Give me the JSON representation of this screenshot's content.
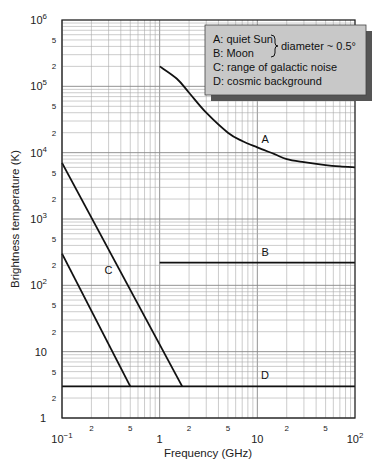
{
  "chart_data": {
    "type": "line",
    "title": "",
    "xlabel": "Frequency (GHz)",
    "ylabel": "Brightness temperature (K)",
    "xscale": "log",
    "yscale": "log",
    "xlim": [
      0.1,
      100
    ],
    "ylim": [
      1,
      1000000
    ],
    "grid": true,
    "x_major_ticks": [
      {
        "value": 0.1,
        "base": "10",
        "exp": "−1"
      },
      {
        "value": 1,
        "label": "1"
      },
      {
        "value": 10,
        "label": "10"
      },
      {
        "value": 100,
        "base": "10",
        "exp": "2"
      }
    ],
    "x_minor_labels": [
      {
        "value": 0.2,
        "label": "2"
      },
      {
        "value": 0.5,
        "label": "5"
      },
      {
        "value": 2,
        "label": "2"
      },
      {
        "value": 5,
        "label": "5"
      },
      {
        "value": 20,
        "label": "2"
      },
      {
        "value": 50,
        "label": "5"
      }
    ],
    "y_major_ticks": [
      {
        "value": 1,
        "label": "1"
      },
      {
        "value": 10,
        "label": "10"
      },
      {
        "value": 100,
        "base": "10",
        "exp": "2"
      },
      {
        "value": 1000,
        "base": "10",
        "exp": "3"
      },
      {
        "value": 10000,
        "base": "10",
        "exp": "4"
      },
      {
        "value": 100000,
        "base": "10",
        "exp": "5"
      },
      {
        "value": 1000000,
        "base": "10",
        "exp": "6"
      }
    ],
    "y_minor_labels": [
      {
        "value": 2,
        "label": "2"
      },
      {
        "value": 5,
        "label": "5"
      },
      {
        "value": 20,
        "label": "2"
      },
      {
        "value": 50,
        "label": "5"
      },
      {
        "value": 200,
        "label": "2"
      },
      {
        "value": 500,
        "label": "5"
      },
      {
        "value": 2000,
        "label": "2"
      },
      {
        "value": 5000,
        "label": "5"
      },
      {
        "value": 20000,
        "label": "2"
      },
      {
        "value": 50000,
        "label": "5"
      },
      {
        "value": 200000,
        "label": "2"
      },
      {
        "value": 500000,
        "label": "5"
      }
    ],
    "series": [
      {
        "name": "A: quiet Sun",
        "label": "A",
        "label_at": [
          12,
          14000
        ],
        "x": [
          1,
          1.5,
          2,
          3,
          5,
          7,
          10,
          15,
          20,
          30,
          50,
          70,
          100
        ],
        "y": [
          200000,
          130000,
          80000,
          40000,
          20000,
          15000,
          12000,
          9500,
          8000,
          7200,
          6500,
          6200,
          6000
        ]
      },
      {
        "name": "B: Moon",
        "label": "B",
        "label_at": [
          12,
          280
        ],
        "x": [
          1,
          100
        ],
        "y": [
          220,
          220
        ]
      },
      {
        "name": "C: range of galactic noise (upper bound)",
        "label": "C",
        "label_at": [
          0.3,
          150
        ],
        "x": [
          0.1,
          1.7
        ],
        "y": [
          7000,
          3
        ]
      },
      {
        "name": "C: range of galactic noise (lower bound)",
        "x": [
          0.1,
          0.5
        ],
        "y": [
          300,
          3
        ]
      },
      {
        "name": "D: cosmic background",
        "label": "D",
        "label_at": [
          12,
          3.9
        ],
        "x": [
          0.1,
          100
        ],
        "y": [
          3,
          3
        ]
      }
    ]
  },
  "legend": {
    "lines": [
      "A: quiet Sun",
      "B: Moon",
      "C: range of galactic noise",
      "D: cosmic background"
    ],
    "brace_note": "diameter ~ 0.5°",
    "box_color": "#c8c8c8",
    "shadow_color": "#555555"
  },
  "labels": {
    "xlabel": "Frequency (GHz)",
    "ylabel": "Brightness temperature (K)"
  }
}
